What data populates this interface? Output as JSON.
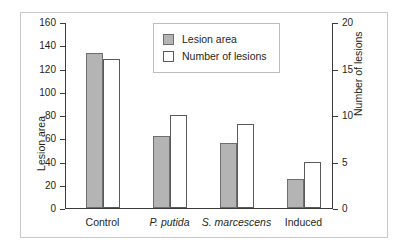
{
  "chart_data": {
    "type": "bar",
    "title": "",
    "categories": [
      "Control",
      "P. putida",
      "S. marcescens",
      "Induced"
    ],
    "categories_italic": [
      false,
      true,
      true,
      false
    ],
    "series": [
      {
        "name": "Lesion area",
        "axis": "left",
        "values": [
          133,
          62,
          56,
          25
        ],
        "fill": "#b4b4b4",
        "edge": "#6e6e6e"
      },
      {
        "name": "Number of lesions",
        "axis": "right",
        "values": [
          16,
          10,
          9,
          5
        ],
        "fill": "#ffffff",
        "edge": "#5a5a5a"
      }
    ],
    "xlabel": "",
    "ylabel": "Lesion area",
    "ylabel_right": "Number of lesions",
    "ylim": [
      0,
      160
    ],
    "yticks": [
      0,
      20,
      40,
      60,
      80,
      100,
      120,
      140,
      160
    ],
    "ylim_right": [
      0,
      20
    ],
    "yticks_right": [
      0,
      5,
      10,
      15,
      20
    ],
    "grid": false,
    "legend_position": "top-center",
    "legend": [
      "Lesion area",
      "Number of lesions"
    ]
  },
  "legend": {
    "items": [
      {
        "label": "Lesion area",
        "swatch": "gray-square"
      },
      {
        "label": "Number of lesions",
        "swatch": "white-square"
      }
    ]
  },
  "axes": {
    "left": {
      "title": "Lesion area",
      "ticks": [
        "0",
        "20",
        "40",
        "60",
        "80",
        "100",
        "120",
        "140",
        "160"
      ]
    },
    "right": {
      "title": "Number of lesions",
      "ticks": [
        "0",
        "5",
        "10",
        "15",
        "20"
      ]
    }
  }
}
